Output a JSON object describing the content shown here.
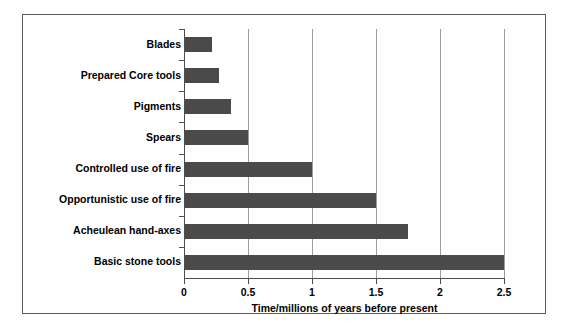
{
  "chart_data": {
    "type": "bar",
    "orientation": "horizontal",
    "title": "",
    "subtitle": "",
    "xlabel": "Time/millions of years before present",
    "ylabel": "",
    "categories": [
      "Blades",
      "Prepared Core tools",
      "Pigments",
      "Spears",
      "Controlled use of fire",
      "Opportunistic use of fire",
      "Acheulean hand-axes",
      "Basic stone tools"
    ],
    "values": [
      0.22,
      0.27,
      0.37,
      0.5,
      1.0,
      1.5,
      1.75,
      2.5
    ],
    "xlim": [
      0,
      2.5
    ],
    "xticks": [
      0,
      0.5,
      1,
      1.5,
      2,
      2.5
    ],
    "xtick_labels": [
      "0",
      "0.5",
      "1",
      "1.5",
      "2",
      "2.5"
    ],
    "grid": "vertical",
    "legend": "none",
    "bar_color": "#4a4a4a",
    "gridline_color": "#9b9b9b",
    "axis_color": "#4d4d4d",
    "frame_color": "#555b60",
    "background": "#ffffff"
  }
}
